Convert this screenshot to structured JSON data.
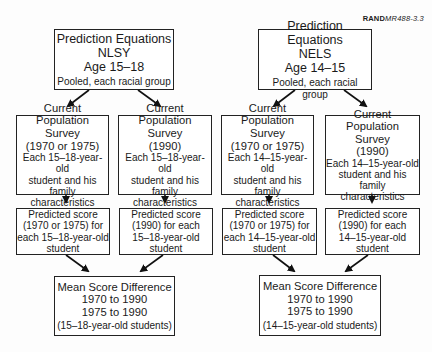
{
  "figure_tag": {
    "prefix": "RAND",
    "id": "MR488-3.3"
  },
  "columns": [
    {
      "source": {
        "title": "Prediction Equations",
        "dataset": "NLSY",
        "age": "Age 15–18",
        "note": "Pooled, each racial group"
      },
      "cps_a": {
        "l1": "Current Population",
        "l2": "Survey",
        "l3": "(1970 or 1975)",
        "l4": "Each 15–18-year-old",
        "l5": "student and his family",
        "l6": "characteristics"
      },
      "cps_b": {
        "l1": "Current Population",
        "l2": "Survey",
        "l3": "(1990)",
        "l4": "Each 15–18-year-old",
        "l5": "student and his family",
        "l6": "characteristics"
      },
      "pred_a": {
        "l1": "Predicted score",
        "l2": "(1970 or 1975) for",
        "l3": "each 15–18-year-old",
        "l4": "student"
      },
      "pred_b": {
        "l1": "Predicted score",
        "l2": "(1990) for each",
        "l3": "15–18-year-old",
        "l4": "student"
      },
      "result": {
        "l1": "Mean Score Difference",
        "l2": "1970 to 1990",
        "l3": "1975 to 1990",
        "l4": "(15–18-year-old students)"
      }
    },
    {
      "source": {
        "title": "Prediction Equations",
        "dataset": "NELS",
        "age": "Age 14–15",
        "note": "Pooled, each racial group"
      },
      "cps_a": {
        "l1": "Current Population",
        "l2": "Survey",
        "l3": "(1970 or 1975)",
        "l4": "Each 14–15-year-old",
        "l5": "student and his family",
        "l6": "characteristics"
      },
      "cps_b": {
        "l1": "Current Population",
        "l2": "Survey",
        "l3": "(1990)",
        "l4": "Each 14–15-year-old",
        "l5": "student and his family",
        "l6": "characteristics"
      },
      "pred_a": {
        "l1": "Predicted score",
        "l2": "(1970 or 1975) for",
        "l3": "each 14–15-year-old",
        "l4": "student"
      },
      "pred_b": {
        "l1": "Predicted score",
        "l2": "(1990) for each",
        "l3": "14–15-year-old",
        "l4": "student"
      },
      "result": {
        "l1": "Mean Score Difference",
        "l2": "1970 to 1990",
        "l3": "1975 to 1990",
        "l4": "(14–15-year-old students)"
      }
    }
  ]
}
